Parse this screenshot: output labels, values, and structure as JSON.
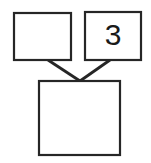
{
  "diagram": {
    "type": "tree-diagram",
    "background_color": "#ffffff",
    "line_color": "#262626",
    "fill_color": "#ffffff",
    "canvas": {
      "width": 151,
      "height": 163
    },
    "nodes": [
      {
        "id": "top-left-node",
        "name": "empty-box-top-left",
        "label": "",
        "x": 14,
        "y": 13,
        "width": 57,
        "height": 47
      },
      {
        "id": "top-right-node",
        "name": "numbered-box-top-right",
        "label": "3",
        "x": 85,
        "y": 12,
        "width": 56,
        "height": 48,
        "label_x": 113,
        "label_y": 36
      },
      {
        "id": "bottom-node",
        "name": "empty-box-bottom",
        "label": "",
        "x": 39,
        "y": 81,
        "width": 81,
        "height": 74
      }
    ],
    "connectors": [
      {
        "id": "connector-left",
        "name": "connector-top-left-to-bottom",
        "from": "top-left-node",
        "to": "bottom-node",
        "x1": 48,
        "y1": 60,
        "x2": 80,
        "y2": 81
      },
      {
        "id": "connector-right",
        "name": "connector-top-right-to-bottom",
        "from": "top-right-node",
        "to": "bottom-node",
        "x1": 110,
        "y1": 60,
        "x2": 80,
        "y2": 81
      }
    ]
  }
}
